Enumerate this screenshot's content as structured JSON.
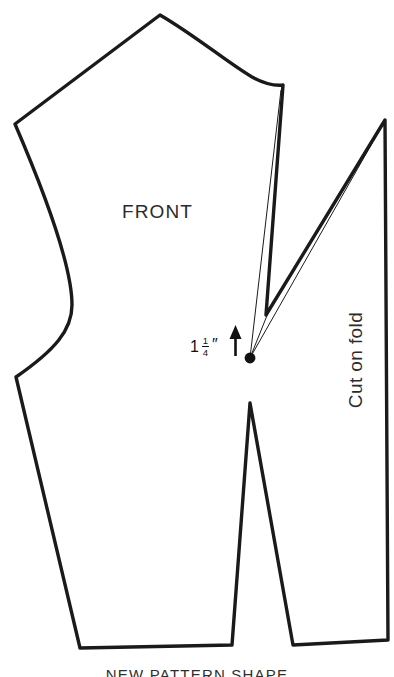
{
  "figure": {
    "type": "sewing-pattern-diagram",
    "piece_label": "FRONT",
    "fold_label": "Cut on fold",
    "caption": "NEW PATTERN SHAPE",
    "background_color": "#ffffff",
    "line_color": "#1a1a1a"
  },
  "measurement": {
    "whole": "1",
    "numerator": "1",
    "denominator": "4",
    "unit_mark": "″",
    "full_text": "1 1/4″",
    "direction_icon": "up-arrow-icon"
  },
  "markers": {
    "pivot_point": "pivot-dot"
  }
}
